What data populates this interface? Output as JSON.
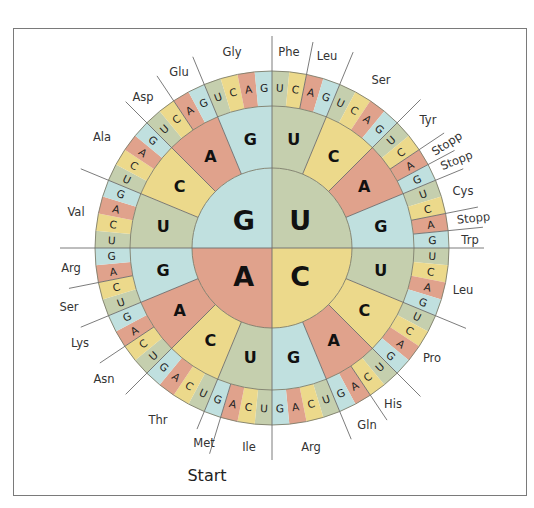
{
  "colors": {
    "U": "#c5cfae",
    "C": "#ecd98b",
    "A": "#e0a28c",
    "G": "#c0e0df"
  },
  "geometry": {
    "center": [
      272,
      248
    ],
    "r_inner": 80,
    "r_middle": 142,
    "r_outer": 177,
    "r_line_end": 207
  },
  "bases_order": [
    "U",
    "C",
    "A",
    "G"
  ],
  "inner_ring": [
    "U",
    "C",
    "A",
    "G"
  ],
  "codon_table": {
    "UU": [
      "Phe",
      "Phe",
      "Leu",
      "Leu"
    ],
    "UC": [
      "Ser",
      "Ser",
      "Ser",
      "Ser"
    ],
    "UA": [
      "Tyr",
      "Tyr",
      "Stopp",
      "Stopp"
    ],
    "UG": [
      "Cys",
      "Cys",
      "Stopp",
      "Trp"
    ],
    "CU": [
      "Leu",
      "Leu",
      "Leu",
      "Leu"
    ],
    "CC": [
      "Pro",
      "Pro",
      "Pro",
      "Pro"
    ],
    "CA": [
      "His",
      "His",
      "Gln",
      "Gln"
    ],
    "CG": [
      "Arg",
      "Arg",
      "Arg",
      "Arg"
    ],
    "AU": [
      "Ile",
      "Ile",
      "Ile",
      "Met"
    ],
    "AC": [
      "Thr",
      "Thr",
      "Thr",
      "Thr"
    ],
    "AA": [
      "Asn",
      "Asn",
      "Lys",
      "Lys"
    ],
    "AG": [
      "Ser",
      "Ser",
      "Arg",
      "Arg"
    ],
    "GU": [
      "Val",
      "Val",
      "Val",
      "Val"
    ],
    "GC": [
      "Ala",
      "Ala",
      "Ala",
      "Ala"
    ],
    "GA": [
      "Asp",
      "Asp",
      "Glu",
      "Glu"
    ],
    "GG": [
      "Gly",
      "Gly",
      "Gly",
      "Gly"
    ]
  },
  "amino_acid_labels": [
    {
      "text": "Phe",
      "x": 289,
      "y": 56,
      "rot": 0
    },
    {
      "text": "Leu",
      "x": 327,
      "y": 60,
      "rot": 0
    },
    {
      "text": "Ser",
      "x": 381,
      "y": 84,
      "rot": 0
    },
    {
      "text": "Tyr",
      "x": 428,
      "y": 124,
      "rot": 0
    },
    {
      "text": "Stopp",
      "x": 449,
      "y": 147,
      "rot": -33
    },
    {
      "text": "Stopp",
      "x": 458,
      "y": 164,
      "rot": -22
    },
    {
      "text": "Cys",
      "x": 463,
      "y": 195,
      "rot": 0
    },
    {
      "text": "Stopp",
      "x": 474,
      "y": 222,
      "rot": -6
    },
    {
      "text": "Trp",
      "x": 470,
      "y": 244,
      "rot": 0
    },
    {
      "text": "Leu",
      "x": 463,
      "y": 294,
      "rot": 0
    },
    {
      "text": "Pro",
      "x": 432,
      "y": 362,
      "rot": 0
    },
    {
      "text": "His",
      "x": 393,
      "y": 408,
      "rot": 0
    },
    {
      "text": "Gln",
      "x": 367,
      "y": 429,
      "rot": 0
    },
    {
      "text": "Arg",
      "x": 311,
      "y": 451,
      "rot": 0
    },
    {
      "text": "Ile",
      "x": 249,
      "y": 451,
      "rot": 0
    },
    {
      "text": "Met",
      "x": 204,
      "y": 447,
      "rot": 0
    },
    {
      "text": "Thr",
      "x": 158,
      "y": 424,
      "rot": 0
    },
    {
      "text": "Asn",
      "x": 104,
      "y": 383,
      "rot": 0
    },
    {
      "text": "Lys",
      "x": 80,
      "y": 347,
      "rot": 0
    },
    {
      "text": "Ser",
      "x": 69,
      "y": 311,
      "rot": 0
    },
    {
      "text": "Arg",
      "x": 71,
      "y": 272,
      "rot": 0
    },
    {
      "text": "Val",
      "x": 76,
      "y": 216,
      "rot": 0
    },
    {
      "text": "Ala",
      "x": 102,
      "y": 141,
      "rot": 0
    },
    {
      "text": "Asp",
      "x": 143,
      "y": 101,
      "rot": 0
    },
    {
      "text": "Glu",
      "x": 179,
      "y": 76,
      "rot": 0
    },
    {
      "text": "Gly",
      "x": 232,
      "y": 56,
      "rot": 0
    }
  ],
  "start_label": {
    "text": "Start",
    "x": 207,
    "y": 481
  },
  "divider_lines": [
    {
      "angle": 0,
      "from": 0,
      "to": 212
    },
    {
      "angle": 90,
      "from": 0,
      "to": 212
    },
    {
      "angle": 180,
      "from": 0,
      "to": 212
    },
    {
      "angle": 270,
      "from": 0,
      "to": 212
    },
    {
      "angle": 11.25,
      "from": 142,
      "to": 210
    },
    {
      "angle": 22.5,
      "from": 80,
      "to": 212
    },
    {
      "angle": 45,
      "from": 80,
      "to": 210
    },
    {
      "angle": 56.25,
      "from": 142,
      "to": 207
    },
    {
      "angle": 61.875,
      "from": 142,
      "to": 207
    },
    {
      "angle": 67.5,
      "from": 80,
      "to": 207
    },
    {
      "angle": 78.75,
      "from": 142,
      "to": 210
    },
    {
      "angle": 84.375,
      "from": 142,
      "to": 212
    },
    {
      "angle": 112.5,
      "from": 80,
      "to": 210
    },
    {
      "angle": 135,
      "from": 80,
      "to": 210
    },
    {
      "angle": 146.25,
      "from": 142,
      "to": 207
    },
    {
      "angle": 157.5,
      "from": 80,
      "to": 207
    },
    {
      "angle": 202.5,
      "from": 80,
      "to": 196
    },
    {
      "angle": 196.875,
      "from": 142,
      "to": 215
    },
    {
      "angle": 225,
      "from": 80,
      "to": 207
    },
    {
      "angle": 236.25,
      "from": 142,
      "to": 207
    },
    {
      "angle": 247.5,
      "from": 80,
      "to": 207
    },
    {
      "angle": 258.75,
      "from": 142,
      "to": 207
    },
    {
      "angle": 292.5,
      "from": 80,
      "to": 207
    },
    {
      "angle": 315,
      "from": 80,
      "to": 207
    },
    {
      "angle": 326.25,
      "from": 142,
      "to": 207
    },
    {
      "angle": 337.5,
      "from": 80,
      "to": 207
    }
  ]
}
